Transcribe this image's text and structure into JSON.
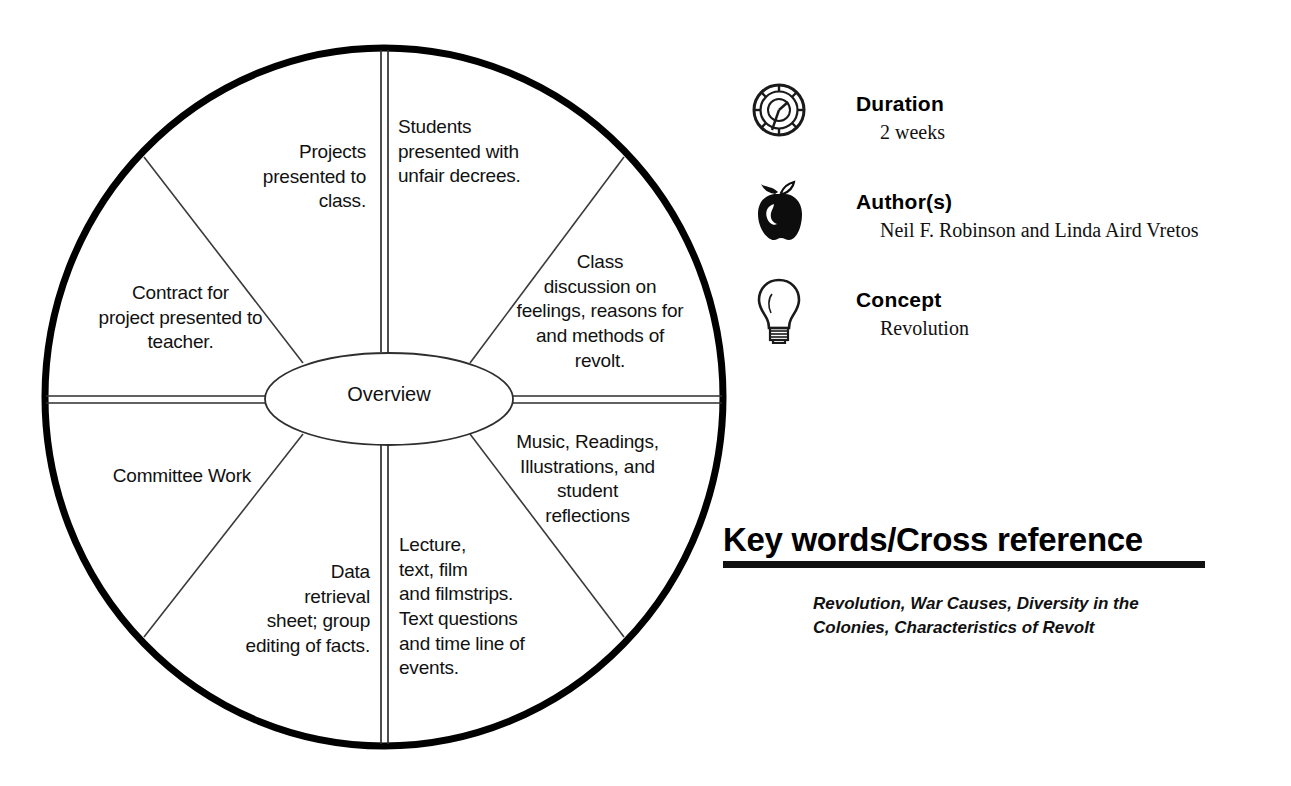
{
  "diagram": {
    "center_label": "Overview",
    "segments": [
      {
        "id": "students-unfair-decrees",
        "text": "Students\npresented with\nunfair decrees.",
        "align": "left"
      },
      {
        "id": "class-discussion",
        "text": "Class\ndiscussion on\nfeelings, reasons for\nand methods of\nrevolt.",
        "align": "center"
      },
      {
        "id": "music-readings",
        "text": "Music, Readings,\nIllustrations, and\nstudent\nreflections",
        "align": "center"
      },
      {
        "id": "lecture-text-film",
        "text": "Lecture,\ntext, film\nand filmstrips.\nText questions\nand time line of\nevents.",
        "align": "left"
      },
      {
        "id": "data-retrieval",
        "text": "Data\nretrieval\nsheet; group\nediting of facts.",
        "align": "right"
      },
      {
        "id": "committee-work",
        "text": "Committee Work",
        "align": "center"
      },
      {
        "id": "contract-for-project",
        "text": "Contract for\nproject presented to\nteacher.",
        "align": "center"
      },
      {
        "id": "projects-presented",
        "text": "Projects\npresented to\nclass.",
        "align": "right"
      }
    ]
  },
  "info": {
    "rows": [
      {
        "icon": "stopwatch-icon",
        "heading": "Duration",
        "value": "2 weeks"
      },
      {
        "icon": "apple-icon",
        "heading": "Author(s)",
        "value": "Neil F. Robinson and Linda Aird Vretos"
      },
      {
        "icon": "lightbulb-icon",
        "heading": "Concept",
        "value": "Revolution"
      }
    ]
  },
  "keywords": {
    "title": "Key words/Cross reference",
    "list": "Revolution, War Causes, Diversity in the Colonies, Characteristics of Revolt"
  },
  "colors": {
    "ink": "#111111",
    "outline": "#000000",
    "paper": "#ffffff"
  }
}
